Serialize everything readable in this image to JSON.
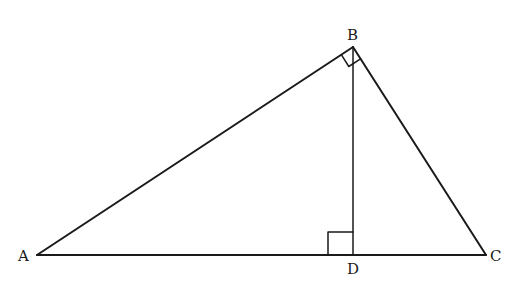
{
  "diagram": {
    "title": "",
    "type": "right-triangle-with-altitude",
    "stroke_color": "#1a1a1a",
    "background": "#ffffff",
    "points": {
      "A": {
        "label": "A",
        "x": 37,
        "y": 255
      },
      "B": {
        "label": "B",
        "x": 353,
        "y": 47
      },
      "C": {
        "label": "C",
        "x": 486,
        "y": 255
      },
      "D": {
        "label": "D",
        "x": 353,
        "y": 255
      }
    },
    "segments": [
      "AB",
      "BC",
      "AC",
      "BD"
    ],
    "right_angles": [
      {
        "vertex": "B",
        "between": [
          "A",
          "C"
        ]
      },
      {
        "vertex": "D",
        "between": [
          "A",
          "B"
        ]
      }
    ]
  }
}
